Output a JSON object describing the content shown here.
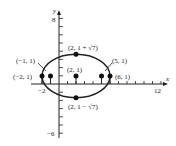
{
  "chart_data": {
    "type": "scatter",
    "title": "",
    "xlabel": "x",
    "ylabel": "y",
    "xlim": [
      -2,
      12
    ],
    "ylim": [
      -6,
      8
    ],
    "x_tick_labels": [
      "-2",
      "12"
    ],
    "y_tick_labels": [
      "8",
      "-6"
    ],
    "grid": false,
    "curve": {
      "kind": "ellipse",
      "center": [
        2,
        1
      ],
      "semi_major_x": 4,
      "semi_minor_y": 2.6458
    },
    "points": [
      {
        "x": 2,
        "y": 3.6458,
        "label": "(2, 1 + √7)"
      },
      {
        "x": 2,
        "y": -1.6458,
        "label": "(2, 1 − √7)"
      },
      {
        "x": 2,
        "y": 1,
        "label": "(2, 1)"
      },
      {
        "x": -2,
        "y": 1,
        "label": "(−2, 1)"
      },
      {
        "x": -1,
        "y": 1,
        "label": "(−1, 1)"
      },
      {
        "x": 5,
        "y": 1,
        "label": "(5, 1)"
      },
      {
        "x": 6,
        "y": 1,
        "label": "(6, 1)"
      }
    ]
  },
  "axes": {
    "x_label": "x",
    "y_label": "y",
    "x_min_label": "−2",
    "x_max_label": "12",
    "y_max_label": "8",
    "y_min_label": "−6"
  },
  "labels": {
    "top": "(2, 1 + √7)",
    "bottom": "(2, 1 − √7)",
    "center": "(2, 1)",
    "left_vertex": "(−2, 1)",
    "left_focus": "(−1, 1)",
    "right_focus": "(5, 1)",
    "right_vertex": "(6, 1)"
  }
}
